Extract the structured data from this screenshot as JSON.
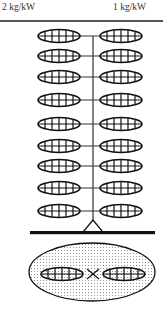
{
  "header": {
    "left_label": "2 kg/kW",
    "right_label": "1 kg/kW"
  },
  "diagram": {
    "stem_x": 93,
    "rows_y": [
      36,
      56,
      77,
      100,
      124,
      146,
      166,
      188,
      211
    ],
    "left_blade": {
      "cx": 59,
      "rx": 21,
      "ry": 6.5
    },
    "right_blade": {
      "cx": 121,
      "rx": 21,
      "ry": 6.5
    },
    "base": {
      "apex_y": 220,
      "bar_y": 232,
      "bar_x1": 30,
      "bar_x2": 155
    },
    "top_view": {
      "outer": {
        "cx": 92,
        "cy": 272,
        "rx": 63,
        "ry": 29
      },
      "left_blade": {
        "cx": 62,
        "cy": 274,
        "rx": 21,
        "ry": 6.5
      },
      "right_blade": {
        "cx": 124,
        "cy": 274,
        "rx": 21,
        "ry": 6.5
      },
      "cross_x": 93
    },
    "stroke_color": "#111111"
  }
}
